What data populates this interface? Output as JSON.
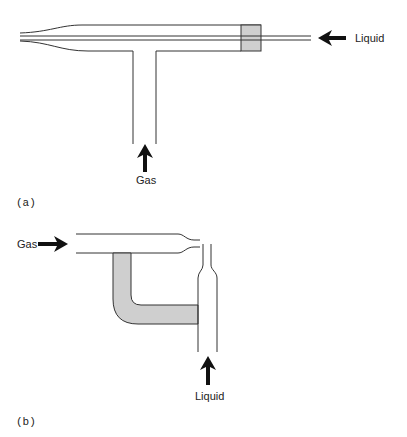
{
  "figure": {
    "panels": [
      {
        "id": "a",
        "caption": "(a)",
        "labels": {
          "liquid": "Liquid",
          "gas": "Gas"
        },
        "description": "Concentric nebulizer: liquid capillary inside gas tube, gas enters from side arm"
      },
      {
        "id": "b",
        "caption": "(b)",
        "labels": {
          "gas": "Gas",
          "liquid": "Liquid"
        },
        "description": "Cross-flow nebulizer: gas nozzle perpendicular to liquid capillary"
      }
    ],
    "colors": {
      "line": "#333333",
      "fill_shaded": "#cfcfcf",
      "background": "#ffffff"
    }
  }
}
